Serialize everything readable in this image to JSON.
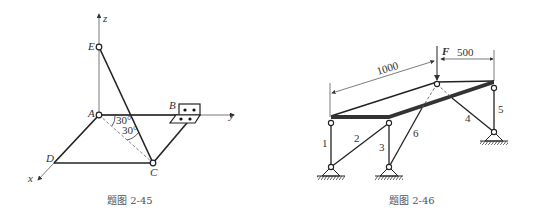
{
  "figures": [
    {
      "caption": "题图 2-45",
      "axes": {
        "x": "x",
        "y": "y",
        "z": "z"
      },
      "points": {
        "A": "A",
        "B": "B",
        "C": "C",
        "D": "D",
        "E": "E"
      },
      "angles": [
        "30°",
        "30°"
      ]
    },
    {
      "caption": "题图 2-46",
      "force": "F",
      "dimensions": [
        "1000",
        "500"
      ],
      "members": [
        "1",
        "2",
        "3",
        "4",
        "5",
        "6"
      ]
    }
  ]
}
